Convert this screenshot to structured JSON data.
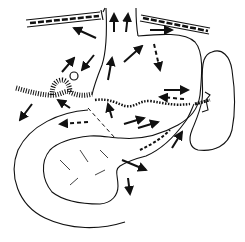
{
  "diagram": {
    "type": "anatomical-line-drawing",
    "background": "#ffffff",
    "ink": "#111111",
    "structures": [
      {
        "name": "vessel-left",
        "kind": "vessel"
      },
      {
        "name": "vessel-right",
        "kind": "vessel"
      },
      {
        "name": "central-tube",
        "kind": "duct"
      },
      {
        "name": "upper-sac",
        "kind": "organ-outline"
      },
      {
        "name": "ear-shaped-organ",
        "kind": "organ"
      },
      {
        "name": "coiled-vessel-left",
        "kind": "vessel"
      },
      {
        "name": "lobulated-organ",
        "kind": "organ"
      },
      {
        "name": "curved-loop",
        "kind": "outline"
      },
      {
        "name": "dotted-boundary",
        "kind": "boundary"
      }
    ],
    "arrows": {
      "solid": 18,
      "dashed": 4
    }
  }
}
